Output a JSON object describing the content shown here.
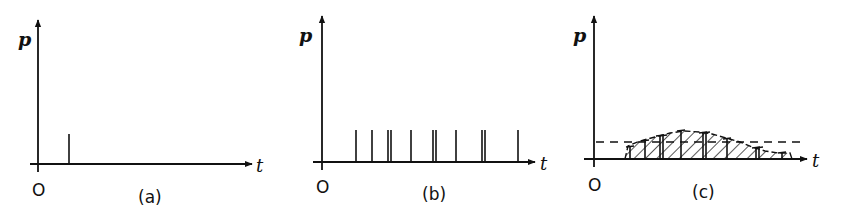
{
  "figure": {
    "stroke_color": "#111111",
    "background": "#ffffff",
    "panels": [
      {
        "id": "a",
        "caption": "(a)",
        "y_label": "p",
        "x_label": "t",
        "origin_label": "O",
        "origin": [
          38,
          164
        ],
        "y_axis_top": 20,
        "x_axis_start": 30,
        "x_axis_end": 252,
        "y_label_pos": [
          18,
          46
        ],
        "x_label_pos": [
          256,
          172
        ],
        "origin_label_pos": [
          32,
          196
        ],
        "caption_pos": [
          138,
          203
        ],
        "impulses": [
          {
            "x": 69,
            "top": 134
          }
        ]
      },
      {
        "id": "b",
        "caption": "(b)",
        "y_label": "p",
        "x_label": "t",
        "origin_label": "O",
        "origin": [
          322,
          162
        ],
        "y_axis_top": 16,
        "x_axis_start": 313,
        "x_axis_end": 535,
        "y_label_pos": [
          299,
          42
        ],
        "x_label_pos": [
          540,
          170
        ],
        "origin_label_pos": [
          316,
          193
        ],
        "caption_pos": [
          422,
          200
        ],
        "impulses": [
          {
            "x": 356,
            "top": 130
          },
          {
            "x": 372,
            "top": 130
          },
          {
            "x": 388,
            "top": 130
          },
          {
            "x": 391,
            "top": 130
          },
          {
            "x": 411,
            "top": 130
          },
          {
            "x": 433,
            "top": 130
          },
          {
            "x": 436,
            "top": 130
          },
          {
            "x": 456,
            "top": 130
          },
          {
            "x": 482,
            "top": 130
          },
          {
            "x": 485,
            "top": 130
          },
          {
            "x": 518,
            "top": 130
          }
        ]
      },
      {
        "id": "c",
        "caption": "(c)",
        "y_label": "p",
        "x_label": "t",
        "origin_label": "O",
        "origin": [
          594,
          159
        ],
        "y_axis_top": 16,
        "x_axis_start": 584,
        "x_axis_end": 807,
        "y_label_pos": [
          573,
          42
        ],
        "x_label_pos": [
          812,
          167
        ],
        "origin_label_pos": [
          588,
          191
        ],
        "caption_pos": [
          692,
          198
        ],
        "mean_level_y": 142,
        "mean_dash_x": [
          596,
          800
        ],
        "envelope": [
          [
            625,
            159
          ],
          [
            628,
            146
          ],
          [
            640,
            141
          ],
          [
            655,
            137
          ],
          [
            670,
            133
          ],
          [
            684,
            131
          ],
          [
            700,
            132
          ],
          [
            712,
            134
          ],
          [
            726,
            138
          ],
          [
            740,
            142
          ],
          [
            752,
            147
          ],
          [
            765,
            151
          ],
          [
            778,
            153
          ],
          [
            790,
            153
          ],
          [
            792,
            159
          ]
        ],
        "impulse_posts": [
          {
            "x": 630,
            "top": 147
          },
          {
            "x": 645,
            "top": 141
          },
          {
            "x": 660,
            "top": 136
          },
          {
            "x": 663,
            "top": 136
          },
          {
            "x": 681,
            "top": 131
          },
          {
            "x": 703,
            "top": 133
          },
          {
            "x": 706,
            "top": 133
          },
          {
            "x": 727,
            "top": 139
          },
          {
            "x": 756,
            "top": 148
          },
          {
            "x": 759,
            "top": 148
          },
          {
            "x": 782,
            "top": 153
          }
        ]
      }
    ]
  }
}
